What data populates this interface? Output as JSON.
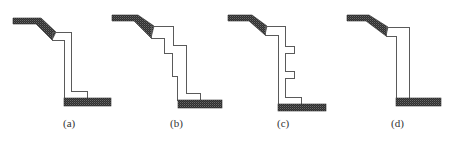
{
  "colors": {
    "background": "#ffffff",
    "outline": "#5a5a5a",
    "hatch_dark": "#2e2e2e",
    "hatch_light": "#6a6a6a",
    "caption": "#333333"
  },
  "figures": [
    {
      "id": "a",
      "caption": "(a)",
      "caption_pos": [
        63,
        117
      ],
      "top_slope_hatch": "13,18 41,18 56,32 52,40 36,24 13,24",
      "wall_outline": "52,32 71,32 71,91 87,91 87,98 64,98 64,40 52,40",
      "base_hatch": [
        64,
        98,
        47,
        8
      ]
    },
    {
      "id": "b",
      "caption": "(b)",
      "caption_pos": [
        170,
        117
      ],
      "top_slope_hatch": "112,15 138,15 154,26 151,38 134,21 112,21",
      "wall_outline": "151,26 173,26 173,45 186,45 186,93 200,93 200,100 177,100 177,76 172,76 172,53 164,53 164,38 151,38",
      "base_hatch": [
        178,
        100,
        44,
        8
      ]
    },
    {
      "id": "c",
      "caption": "(c)",
      "caption_pos": [
        277,
        117
      ],
      "top_slope_hatch": "228,15 252,15 267,26 265,35 249,21 228,21",
      "wall_outline": "265,26 285,26 285,46 294,46 294,53 285,53 285,71 294,71 294,78 285,78 285,97 301,97 301,104 278,104 278,35 265,35",
      "base_hatch": [
        278,
        104,
        48,
        7
      ]
    },
    {
      "id": "d",
      "caption": "(d)",
      "caption_pos": [
        391,
        117
      ],
      "top_slope_hatch": "347,15 369,15 388,27 386,36 366,21 347,21",
      "wall_outline": "386,27 409,27 409,98 396,98 396,36 386,36",
      "base_hatch": [
        396,
        98,
        45,
        8
      ]
    }
  ]
}
